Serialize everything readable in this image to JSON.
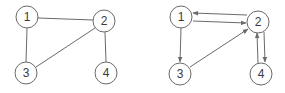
{
  "colors": {
    "stroke": "#6a6a6a",
    "text": "#3a3a3a",
    "background": "#ffffff"
  },
  "undirected_graph": {
    "nodes": [
      {
        "id": "1",
        "label": "1",
        "x": 27,
        "y": 17
      },
      {
        "id": "2",
        "label": "2",
        "x": 104,
        "y": 21
      },
      {
        "id": "3",
        "label": "3",
        "x": 26,
        "y": 73
      },
      {
        "id": "4",
        "label": "4",
        "x": 106,
        "y": 73
      }
    ],
    "edges": [
      {
        "from": "1",
        "to": "2"
      },
      {
        "from": "1",
        "to": "3"
      },
      {
        "from": "2",
        "to": "3"
      },
      {
        "from": "2",
        "to": "4"
      }
    ]
  },
  "directed_graph": {
    "nodes": [
      {
        "id": "1",
        "label": "1",
        "x": 181,
        "y": 17
      },
      {
        "id": "2",
        "label": "2",
        "x": 258,
        "y": 22
      },
      {
        "id": "3",
        "label": "3",
        "x": 180,
        "y": 74
      },
      {
        "id": "4",
        "label": "4",
        "x": 261,
        "y": 74
      }
    ],
    "edges": [
      {
        "from": "2",
        "to": "1"
      },
      {
        "from": "1",
        "to": "2"
      },
      {
        "from": "1",
        "to": "3"
      },
      {
        "from": "3",
        "to": "2"
      },
      {
        "from": "2",
        "to": "4"
      },
      {
        "from": "4",
        "to": "2"
      }
    ]
  }
}
